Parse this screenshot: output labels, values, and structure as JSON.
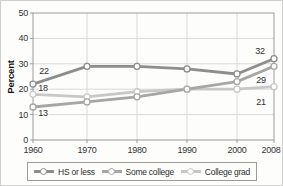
{
  "chart_data": {
    "type": "line",
    "title": "",
    "xlabel": "",
    "ylabel": "Percent",
    "categories": [
      1960,
      1970,
      1980,
      1990,
      2000,
      2008
    ],
    "series": [
      {
        "name": "HS or less",
        "color": "#8d8d8d",
        "values": [
          22,
          29,
          29,
          28,
          26,
          32
        ]
      },
      {
        "name": "Some college",
        "color": "#a6a6a6",
        "values": [
          13,
          15,
          17,
          20,
          23,
          29
        ]
      },
      {
        "name": "College grad",
        "color": "#c8c8c8",
        "values": [
          18,
          17,
          19,
          20,
          20,
          21
        ]
      }
    ],
    "ylim": [
      0,
      50
    ],
    "y_ticks": [
      0,
      10,
      20,
      30,
      40,
      50
    ],
    "x_ticks": [
      1960,
      1970,
      1980,
      1990,
      2000,
      2008
    ],
    "grid": true,
    "legend_position": "bottom",
    "point_labels": [
      {
        "text": "22",
        "year": 1960,
        "value": 22,
        "dx": 11,
        "dy": -13
      },
      {
        "text": "18",
        "year": 1960,
        "value": 18,
        "dx": 10,
        "dy": -6
      },
      {
        "text": "13",
        "year": 1960,
        "value": 13,
        "dx": 10,
        "dy": 6
      },
      {
        "text": "32",
        "year": 2008,
        "value": 32,
        "dx": -14,
        "dy": -8
      },
      {
        "text": "29",
        "year": 2008,
        "value": 29,
        "dx": -13,
        "dy": 14
      },
      {
        "text": "21",
        "year": 2008,
        "value": 21,
        "dx": -13,
        "dy": 15
      }
    ]
  },
  "legend": {
    "items": [
      {
        "label": "HS or less",
        "color": "#8d8d8d"
      },
      {
        "label": "Some college",
        "color": "#a6a6a6"
      },
      {
        "label": "College grad",
        "color": "#c8c8c8"
      }
    ]
  },
  "colors": {
    "grid": "#d9d9d9",
    "axis_box": "#9b9b9b",
    "marker_fill": "#ffffff"
  }
}
